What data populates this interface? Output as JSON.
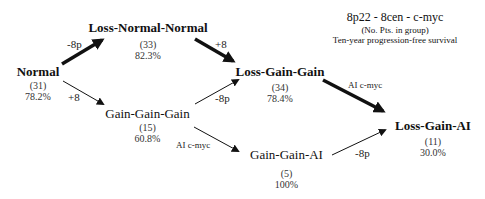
{
  "legend": {
    "title": "8p22 - 8cen - c-myc",
    "line2": "(No. Pts. in group)",
    "line3": "Ten-year progression-free survival"
  },
  "nodes": [
    {
      "id": "normal",
      "label": "Normal",
      "count": "(31)",
      "survival": "78.2%",
      "bold": true
    },
    {
      "id": "loss-normal-normal",
      "label": "Loss-Normal-Normal",
      "count": "(33)",
      "survival": "82.3%",
      "bold": true
    },
    {
      "id": "gain-gain-gain",
      "label": "Gain-Gain-Gain",
      "count": "(15)",
      "survival": "60.8%",
      "bold": false
    },
    {
      "id": "loss-gain-gain",
      "label": "Loss-Gain-Gain",
      "count": "(34)",
      "survival": "78.4%",
      "bold": true
    },
    {
      "id": "gain-gain-ai",
      "label": "Gain-Gain-AI",
      "count": "(5)",
      "survival": "100%",
      "bold": false
    },
    {
      "id": "loss-gain-ai",
      "label": "Loss-Gain-AI",
      "count": "(11)",
      "survival": "30.0%",
      "bold": true
    }
  ],
  "edges": [
    {
      "from": "normal",
      "to": "loss-normal-normal",
      "label": "-8p",
      "thick": true
    },
    {
      "from": "normal",
      "to": "gain-gain-gain",
      "label": "+8",
      "thick": false
    },
    {
      "from": "loss-normal-normal",
      "to": "loss-gain-gain",
      "label": "+8",
      "thick": true
    },
    {
      "from": "gain-gain-gain",
      "to": "loss-gain-gain",
      "label": "-8p",
      "thick": false
    },
    {
      "from": "gain-gain-gain",
      "to": "gain-gain-ai",
      "label": "AI c-myc",
      "thick": false
    },
    {
      "from": "loss-gain-gain",
      "to": "loss-gain-ai",
      "label": "AI c-myc",
      "thick": true
    },
    {
      "from": "gain-gain-ai",
      "to": "loss-gain-ai",
      "label": "-8p",
      "thick": false
    }
  ]
}
